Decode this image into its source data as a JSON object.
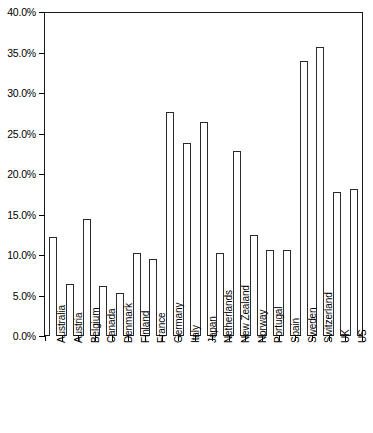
{
  "chart_data": {
    "type": "bar",
    "title": "",
    "xlabel": "",
    "ylabel": "",
    "ylim": [
      0,
      40
    ],
    "yticks": [
      "0.0%",
      "5.0%",
      "10.0%",
      "15.0%",
      "20.0%",
      "25.0%",
      "30.0%",
      "35.0%",
      "40.0%"
    ],
    "ytick_values": [
      0,
      5,
      10,
      15,
      20,
      25,
      30,
      35,
      40
    ],
    "grid": false,
    "legend": "none",
    "categories": [
      "Australia",
      "Austria",
      "Belgium",
      "Canada",
      "Denmark",
      "Finland",
      "France",
      "Germany",
      "Italy",
      "Japan",
      "Netherlands",
      "New Zealand",
      "Norway",
      "Portugal",
      "Spain",
      "Sweden",
      "Switzerland",
      "UK",
      "US"
    ],
    "values": [
      12.2,
      6.4,
      14.5,
      6.2,
      5.3,
      10.2,
      9.5,
      27.7,
      23.8,
      26.4,
      10.2,
      22.9,
      12.5,
      10.6,
      10.6,
      34.0,
      35.7,
      17.8,
      18.2
    ],
    "bar_fill_color": "#ffffff",
    "bar_border_color": "#2b2b2b",
    "axis_color": "#1a1a1a",
    "background_color": "#ffffff"
  }
}
